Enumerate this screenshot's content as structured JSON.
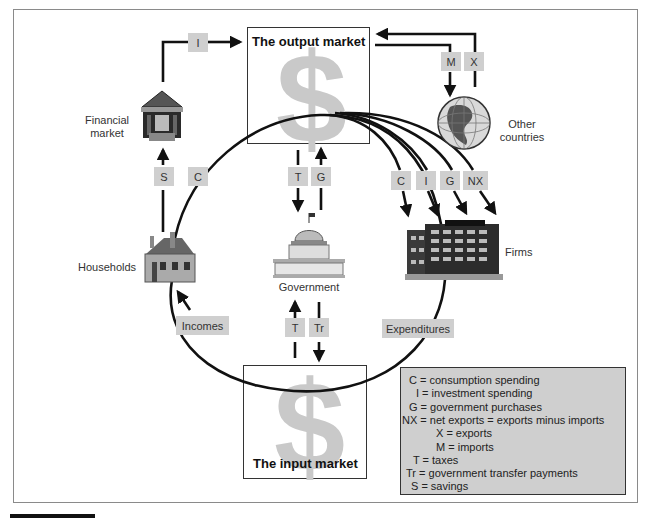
{
  "diagram": {
    "nodes": {
      "output_market": {
        "label": "The output market",
        "icon": "dollar-sign"
      },
      "input_market": {
        "label": "The input market",
        "icon": "dollar-sign"
      },
      "financial_market": {
        "label_line1": "Financial",
        "label_line2": "market",
        "icon": "bank-building-icon"
      },
      "other_countries": {
        "label_line1": "Other",
        "label_line2": "countries",
        "icon": "globe-icon"
      },
      "households": {
        "label": "Households",
        "icon": "house-icon"
      },
      "government": {
        "label": "Government",
        "icon": "capitol-icon"
      },
      "firms": {
        "label": "Firms",
        "icon": "office-building-icon"
      }
    },
    "dollar_glyph": "$",
    "flow_tags": {
      "investment_top": "I",
      "imports": "M",
      "exports": "X",
      "savings": "S",
      "consumption_left": "C",
      "taxes_upper": "T",
      "gov_purchases_upper": "G",
      "firms_c": "C",
      "firms_i": "I",
      "firms_g": "G",
      "firms_nx": "NX",
      "incomes": "Incomes",
      "expenditures": "Expenditures",
      "taxes_lower": "T",
      "transfers_lower": "Tr"
    },
    "legend": [
      {
        "text": "C = consumption spending",
        "indent": 8
      },
      {
        "text": "I = investment spending",
        "indent": 15
      },
      {
        "text": "G = government purchases",
        "indent": 8
      },
      {
        "text": "NX = net exports = exports minus imports",
        "indent": 0
      },
      {
        "text": "X = exports",
        "indent": 35
      },
      {
        "text": "M = imports",
        "indent": 35
      },
      {
        "text": "T = taxes",
        "indent": 12
      },
      {
        "text": "Tr = government transfer payments",
        "indent": 5
      },
      {
        "text": "S = savings",
        "indent": 10
      }
    ],
    "colors": {
      "tag_fill": "#cfcfcf",
      "legend_fill": "#cfcfcf",
      "dollar": "#c9c9c9",
      "line": "#111111"
    }
  }
}
